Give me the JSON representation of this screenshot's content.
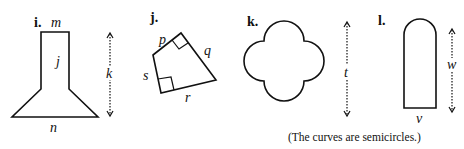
{
  "figures": [
    {
      "number": "i.",
      "labels": {
        "top": "m",
        "side": "j",
        "height": "k",
        "bottom": "n"
      }
    },
    {
      "number": "j.",
      "labels": {
        "p": "p",
        "q": "q",
        "r": "r",
        "s": "s"
      }
    },
    {
      "number": "k.",
      "labels": {
        "height": "t"
      }
    },
    {
      "number": "l.",
      "labels": {
        "height": "w",
        "bottom": "v"
      }
    }
  ],
  "caption": "(The curves are semicircles.)"
}
